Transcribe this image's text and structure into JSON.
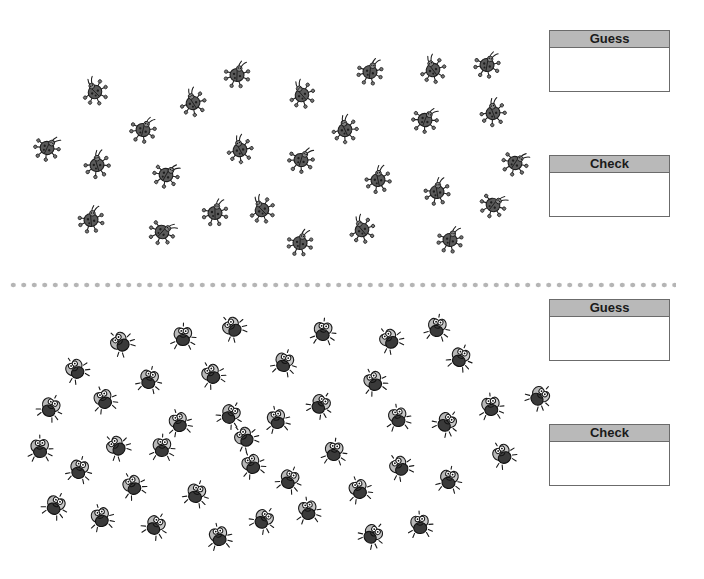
{
  "sections": [
    {
      "name": "ladybugs",
      "creature": "ladybug-icon",
      "boxes": [
        {
          "label": "Guess",
          "value": ""
        },
        {
          "label": "Check",
          "value": ""
        }
      ],
      "positions": [
        [
          95,
          92
        ],
        [
          237,
          75
        ],
        [
          302,
          95
        ],
        [
          370,
          72
        ],
        [
          433,
          70
        ],
        [
          487,
          65
        ],
        [
          193,
          103
        ],
        [
          143,
          130
        ],
        [
          240,
          150
        ],
        [
          301,
          160
        ],
        [
          345,
          130
        ],
        [
          425,
          120
        ],
        [
          493,
          113
        ],
        [
          47,
          148
        ],
        [
          97,
          165
        ],
        [
          166,
          175
        ],
        [
          378,
          180
        ],
        [
          515,
          163
        ],
        [
          437,
          192
        ],
        [
          493,
          205
        ],
        [
          91,
          220
        ],
        [
          162,
          232
        ],
        [
          215,
          213
        ],
        [
          262,
          210
        ],
        [
          300,
          243
        ],
        [
          362,
          230
        ],
        [
          450,
          240
        ]
      ]
    },
    {
      "name": "flies",
      "creature": "fly-icon",
      "boxes": [
        {
          "label": "Guess",
          "value": ""
        },
        {
          "label": "Check",
          "value": ""
        }
      ],
      "positions": [
        [
          121,
          343
        ],
        [
          183,
          337
        ],
        [
          233,
          328
        ],
        [
          323,
          332
        ],
        [
          390,
          340
        ],
        [
          437,
          328
        ],
        [
          76,
          370
        ],
        [
          149,
          380
        ],
        [
          212,
          375
        ],
        [
          284,
          363
        ],
        [
          374,
          382
        ],
        [
          460,
          358
        ],
        [
          104,
          400
        ],
        [
          50,
          408
        ],
        [
          179,
          423
        ],
        [
          230,
          415
        ],
        [
          277,
          420
        ],
        [
          320,
          405
        ],
        [
          398,
          418
        ],
        [
          446,
          423
        ],
        [
          491,
          407
        ],
        [
          539,
          397
        ],
        [
          40,
          449
        ],
        [
          117,
          447
        ],
        [
          162,
          448
        ],
        [
          245,
          438
        ],
        [
          334,
          452
        ],
        [
          400,
          467
        ],
        [
          449,
          480
        ],
        [
          503,
          455
        ],
        [
          79,
          470
        ],
        [
          133,
          486
        ],
        [
          196,
          494
        ],
        [
          252,
          465
        ],
        [
          289,
          480
        ],
        [
          359,
          490
        ],
        [
          55,
          506
        ],
        [
          101,
          518
        ],
        [
          155,
          526
        ],
        [
          219,
          537
        ],
        [
          263,
          520
        ],
        [
          308,
          511
        ],
        [
          372,
          535
        ],
        [
          420,
          525
        ]
      ]
    }
  ],
  "colors": {
    "box_header": "#b9b9b9",
    "box_border": "#6b6b6b",
    "divider_dots": "#b5b5b5",
    "bug_body": "#5a5a5a"
  }
}
